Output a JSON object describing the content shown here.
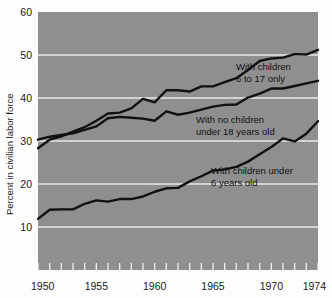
{
  "chart_data": {
    "type": "line",
    "title": "",
    "xlabel": "",
    "ylabel": "Percent in civilian labor force",
    "xlim": [
      1950,
      1974
    ],
    "ylim": [
      0,
      60
    ],
    "yticks": [
      10,
      20,
      30,
      40,
      50,
      60
    ],
    "xticks": [
      1950,
      1955,
      1960,
      1965,
      1970,
      1974
    ],
    "xtick_labels": [
      "1950",
      "1955",
      "1960",
      "1965",
      "1970",
      "1974"
    ],
    "ytick_labels": [
      "10",
      "20",
      "30",
      "40",
      "50",
      "60"
    ],
    "grid": "horizontal",
    "legend_position": "inline-annotations",
    "minor_xticks_every": 1,
    "x": [
      1950,
      1951,
      1952,
      1953,
      1954,
      1955,
      1956,
      1957,
      1958,
      1959,
      1960,
      1961,
      1962,
      1963,
      1964,
      1965,
      1966,
      1967,
      1968,
      1969,
      1970,
      1971,
      1972,
      1973,
      1974
    ],
    "series": [
      {
        "name": "With children 6 to 17 only",
        "annotation": "With children\n6 to 17 only",
        "color": "#111111",
        "values": [
          28.3,
          30.3,
          31.1,
          32.2,
          33.2,
          34.7,
          36.4,
          36.6,
          37.6,
          39.8,
          39.0,
          41.8,
          41.8,
          41.5,
          42.7,
          42.7,
          43.7,
          44.6,
          46.5,
          48.6,
          49.2,
          49.4,
          50.2,
          50.1,
          51.2
        ]
      },
      {
        "name": "With no children under 18 years old",
        "annotation": "With no children\nunder 18 years old",
        "color": "#111111",
        "values": [
          30.3,
          31.0,
          31.4,
          31.8,
          32.6,
          33.4,
          35.3,
          35.6,
          35.4,
          35.2,
          34.7,
          36.9,
          36.1,
          36.6,
          37.3,
          38.0,
          38.4,
          38.5,
          40.1,
          41.0,
          42.2,
          42.2,
          42.8,
          43.4,
          44.0
        ]
      },
      {
        "name": "With children under 6 years old",
        "annotation": "With children under\n6 years old",
        "color": "#111111",
        "values": [
          11.9,
          14.0,
          14.1,
          14.1,
          15.4,
          16.2,
          15.9,
          16.5,
          16.5,
          17.1,
          18.2,
          19.0,
          19.1,
          20.6,
          21.8,
          23.1,
          23.4,
          24.0,
          25.2,
          26.9,
          28.6,
          30.6,
          29.9,
          31.7,
          34.6
        ]
      }
    ]
  },
  "annotations": [
    {
      "line1": "With children",
      "line2": "6 to 17 only"
    },
    {
      "line1": "With no children",
      "line2": "under 18 years old"
    },
    {
      "line1": "With children under",
      "line2": "6 years old"
    }
  ],
  "colors": {
    "plot_background": "#8f8f8f",
    "gridline": "#e8e8e8",
    "line": "#111111",
    "text": "#1a1a1a",
    "page_background": "#fdfdfd"
  }
}
